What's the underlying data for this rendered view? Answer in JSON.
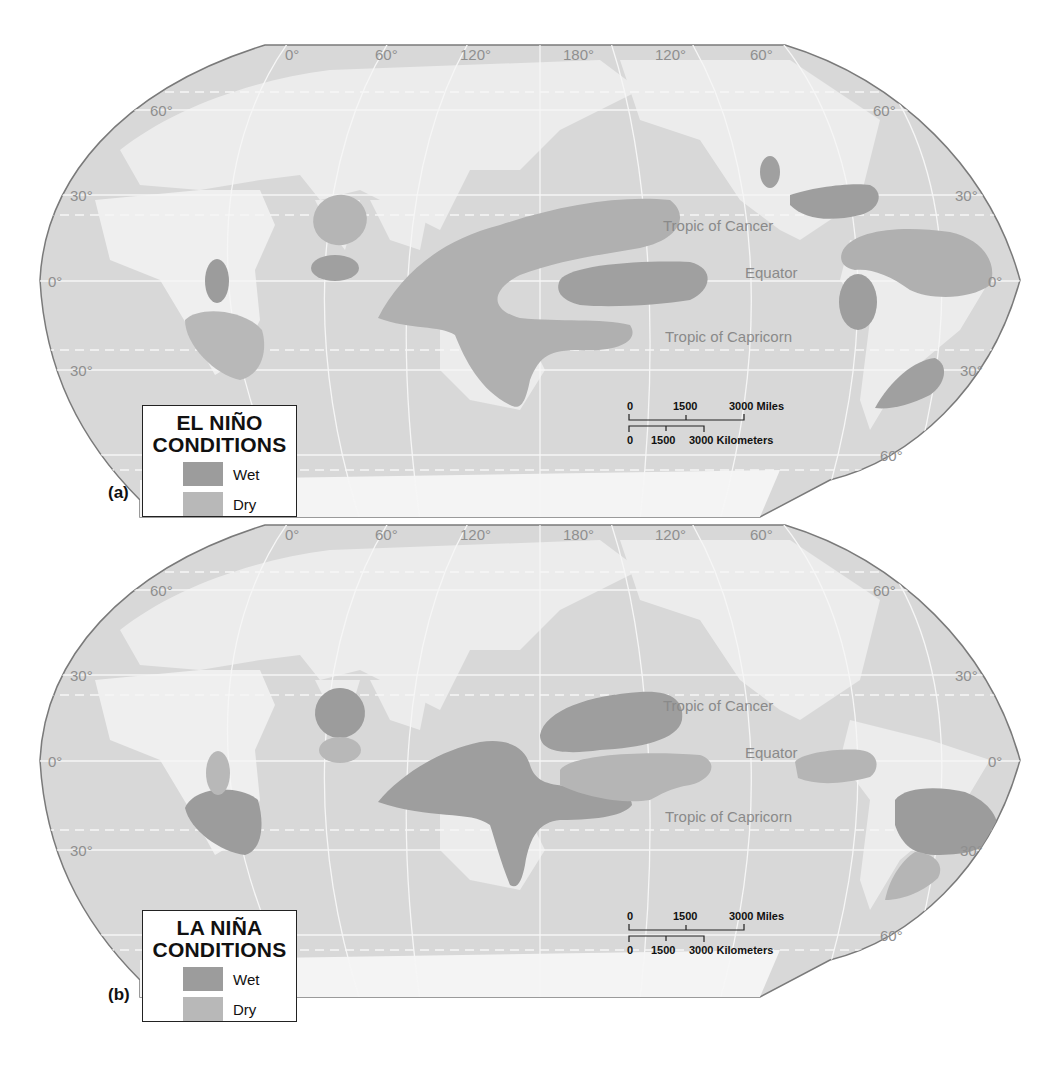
{
  "colors": {
    "ocean": "#d6d6d6",
    "land": "#e9e9e9",
    "grid": "#f7f7f7",
    "wet": "#9a9a9a",
    "dry": "#b7b7b7",
    "frame": "#7a7a7a",
    "text_grey": "#8f8f8f"
  },
  "panels": [
    {
      "tag": "(a)",
      "legend": {
        "title_line1": "EL NIÑO",
        "title_line2": "CONDITIONS",
        "items": [
          {
            "label": "Wet",
            "key": "wet"
          },
          {
            "label": "Dry",
            "key": "dry"
          }
        ]
      },
      "longitude_labels": [
        "0°",
        "60°",
        "120°",
        "180°",
        "120°",
        "60°"
      ],
      "latitude_labels": {
        "left": [
          "60°",
          "30°",
          "0°",
          "30°"
        ],
        "right": [
          "60°",
          "30°",
          "0°",
          "30°",
          "60°"
        ]
      },
      "reference_lines": {
        "cancer": "Tropic of Cancer",
        "equator": "Equator",
        "capricorn": "Tropic of Capricorn"
      },
      "scale": {
        "miles": [
          "0",
          "1500",
          "3000 Miles"
        ],
        "km": [
          "0",
          "1500",
          "3000 Kilometers"
        ]
      },
      "regions": [
        {
          "name": "Southeast Africa",
          "type": "dry"
        },
        {
          "name": "East Africa",
          "type": "wet"
        },
        {
          "name": "India",
          "type": "dry"
        },
        {
          "name": "Sri Lanka",
          "type": "wet"
        },
        {
          "name": "Indonesia / Australia / Western Pacific",
          "type": "dry"
        },
        {
          "name": "Central Pacific",
          "type": "wet"
        },
        {
          "name": "Western US",
          "type": "wet"
        },
        {
          "name": "Gulf Coast US",
          "type": "wet"
        },
        {
          "name": "Northern South America",
          "type": "dry"
        },
        {
          "name": "Ecuador / Peru coast",
          "type": "wet"
        },
        {
          "name": "Southeastern South America",
          "type": "wet"
        }
      ]
    },
    {
      "tag": "(b)",
      "legend": {
        "title_line1": "LA NIÑA",
        "title_line2": "CONDITIONS",
        "items": [
          {
            "label": "Wet",
            "key": "wet"
          },
          {
            "label": "Dry",
            "key": "dry"
          }
        ]
      },
      "longitude_labels": [
        "0°",
        "60°",
        "120°",
        "180°",
        "120°",
        "60°"
      ],
      "latitude_labels": {
        "left": [
          "60°",
          "30°",
          "0°",
          "30°"
        ],
        "right": [
          "60°",
          "30°",
          "0°",
          "30°",
          "60°"
        ]
      },
      "reference_lines": {
        "cancer": "Tropic of Cancer",
        "equator": "Equator",
        "capricorn": "Tropic of Capricorn"
      },
      "scale": {
        "miles": [
          "0",
          "1500",
          "3000 Miles"
        ],
        "km": [
          "0",
          "1500",
          "3000 Kilometers"
        ]
      },
      "regions": [
        {
          "name": "Southeast Africa",
          "type": "wet"
        },
        {
          "name": "East Africa",
          "type": "dry"
        },
        {
          "name": "India",
          "type": "wet"
        },
        {
          "name": "Sri Lanka",
          "type": "dry"
        },
        {
          "name": "Indonesia / Australia / Western Pacific",
          "type": "wet"
        },
        {
          "name": "North-central Pacific",
          "type": "wet"
        },
        {
          "name": "Central Pacific",
          "type": "dry"
        },
        {
          "name": "Gulf Coast US",
          "type": "dry"
        },
        {
          "name": "Northern South America",
          "type": "wet"
        },
        {
          "name": "Southeastern South America",
          "type": "dry"
        }
      ]
    }
  ]
}
